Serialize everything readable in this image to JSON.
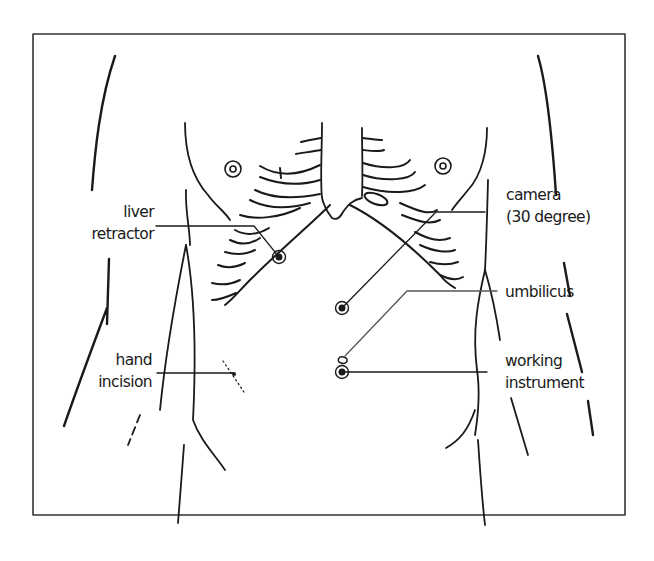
{
  "diagram": {
    "type": "anatomical port-placement illustration",
    "colors": {
      "ink": "#1a1a1a",
      "background": "#ffffff",
      "frame": "#333333"
    },
    "labels": {
      "liver_retractor": {
        "line1": "liver",
        "line2": "retractor"
      },
      "hand_incision": {
        "line1": "hand",
        "line2": "incision"
      },
      "camera": {
        "line1": "camera",
        "line2": "(30 degree)"
      },
      "umbilicus": {
        "line1": "umbilicus"
      },
      "working_instrument": {
        "line1": "working",
        "line2": "instrument"
      }
    },
    "ports": [
      {
        "name": "liver-retractor-port",
        "x": 279,
        "y": 257
      },
      {
        "name": "camera-port",
        "x": 342,
        "y": 308
      },
      {
        "name": "working-instrument-port",
        "x": 342,
        "y": 372
      }
    ]
  }
}
